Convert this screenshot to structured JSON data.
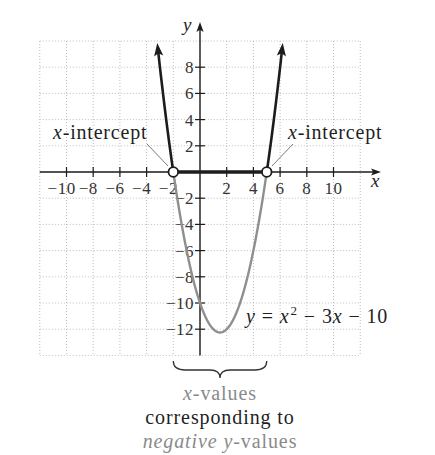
{
  "chart_data": {
    "type": "line",
    "title": "",
    "equation": "y = x^2 - 3x - 10",
    "coefficients": {
      "a": 1,
      "b": -3,
      "c": -10
    },
    "xlabel": "x",
    "ylabel": "y",
    "xlim": [
      -12,
      12
    ],
    "ylim": [
      -14,
      10
    ],
    "grid": true,
    "grid_step": 2,
    "x_ticks": [
      -10,
      -8,
      -6,
      -4,
      -2,
      2,
      4,
      6,
      8,
      10
    ],
    "x_tick_labels": [
      "−10",
      "−8",
      "−6",
      "−4",
      "−2",
      "2",
      "4",
      "6",
      "8",
      "10"
    ],
    "y_ticks": [
      8,
      6,
      4,
      2,
      -2,
      -4,
      -6,
      -8,
      -10,
      -12
    ],
    "y_tick_labels": [
      "8",
      "6",
      "4",
      "2",
      "−2",
      "−4",
      "−6",
      "−8",
      "−10",
      "−12"
    ],
    "x_intercepts": [
      -2,
      5
    ],
    "vertex": [
      1.5,
      -12.25
    ],
    "sample_points": {
      "x": [
        -3,
        -2,
        -1,
        0,
        1,
        1.5,
        2,
        3,
        4,
        5,
        6
      ],
      "y": [
        8,
        0,
        -6,
        -10,
        -12,
        -12.25,
        -12,
        -10,
        -6,
        0,
        8
      ]
    },
    "series": [
      {
        "name": "left branch (y > 0)",
        "x_range": [
          -2,
          -3.2
        ],
        "color": "#1c1c1c",
        "arrow_end": true
      },
      {
        "name": "below x-axis (y < 0)",
        "x_range": [
          -2,
          5
        ],
        "color": "#8f8f8f",
        "arrow_end": false
      },
      {
        "name": "right branch (y > 0)",
        "x_range": [
          5,
          6.2
        ],
        "color": "#1c1c1c",
        "arrow_end": true
      }
    ],
    "highlighted_interval": {
      "x_range": [
        -2,
        5
      ],
      "color": "#1c1c1c"
    },
    "open_points": [
      [
        -2,
        0
      ],
      [
        5,
        0
      ]
    ],
    "annotations": [
      {
        "text": "x-intercept",
        "points_to": [
          -2,
          0
        ]
      },
      {
        "text": "x-intercept",
        "points_to": [
          5,
          0
        ]
      },
      {
        "text": "y = x² − 3x − 10",
        "labels": "parabola"
      },
      {
        "text": "x-values corresponding to negative y-values",
        "brace_over": [
          -2,
          5
        ]
      }
    ]
  },
  "colors": {
    "axis": "#1c1c1c",
    "grid": "#bdbdbd",
    "positive_branch": "#1c1c1c",
    "negative_branch": "#8f8f8f",
    "muted_text": "#8a8a8a",
    "text": "#1f1f1f"
  },
  "labels": {
    "axis_x": "x",
    "axis_y": "y",
    "left_intercept": {
      "var": "x",
      "rest": "-intercept"
    },
    "right_intercept": {
      "var": "x",
      "rest": "-intercept"
    },
    "equation": {
      "y": "y",
      "eq": "=",
      "x": "x",
      "sup": "2",
      "minus1": "−",
      "coef": "3",
      "x2": "x",
      "minus2": "−",
      "const": "10"
    },
    "caption": {
      "line1_var": "x",
      "line1_rest": "-values",
      "line2": "corresponding to",
      "line3_italic1": "negative",
      "line3_italic2": "y",
      "line3_rest": "-values"
    }
  }
}
